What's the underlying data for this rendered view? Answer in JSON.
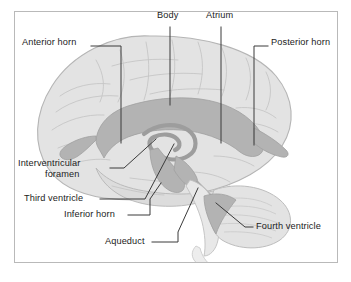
{
  "figure": {
    "kind": "anatomical-illustration",
    "frame_color": "#b9b9b9",
    "background": "#ffffff"
  },
  "palette": {
    "brain_fill": "#e3e3e3",
    "brain_outline": "#b5b5b5",
    "gyri_line": "#c4c4c4",
    "ventricle_fill": "#b3b3b3",
    "ventricle_dark": "#9d9d9d",
    "leader_line": "#3a3a3a",
    "text": "#1c1c1c"
  },
  "labels": [
    {
      "id": "anterior-horn",
      "text": "Anterior horn",
      "x": 22,
      "y": 42,
      "align": "left"
    },
    {
      "id": "body",
      "text": "Body",
      "x": 157,
      "y": 15,
      "align": "left"
    },
    {
      "id": "atrium",
      "text": "Atrium",
      "x": 206,
      "y": 15,
      "align": "left"
    },
    {
      "id": "posterior-horn",
      "text": "Posterior horn",
      "x": 271,
      "y": 42,
      "align": "left"
    },
    {
      "id": "interventricular-foramen",
      "text": "Interventricular",
      "x": 18,
      "y": 163,
      "align": "left"
    },
    {
      "id": "interventricular-foramen2",
      "text": "foramen",
      "x": 45,
      "y": 174,
      "align": "left"
    },
    {
      "id": "third-ventricle",
      "text": "Third ventricle",
      "x": 24,
      "y": 196,
      "align": "left"
    },
    {
      "id": "inferior-horn",
      "text": "Inferior horn",
      "x": 64,
      "y": 212,
      "align": "left"
    },
    {
      "id": "aqueduct",
      "text": "Aqueduct",
      "x": 105,
      "y": 239,
      "align": "left"
    },
    {
      "id": "fourth-ventricle",
      "text": "Fourth ventricle",
      "x": 256,
      "y": 224,
      "align": "left"
    }
  ],
  "structures": [
    "lateral ventricle anterior horn",
    "lateral ventricle body",
    "atrium (trigone)",
    "posterior horn",
    "interventricular foramen",
    "third ventricle",
    "inferior horn",
    "cerebral aqueduct",
    "fourth ventricle"
  ]
}
